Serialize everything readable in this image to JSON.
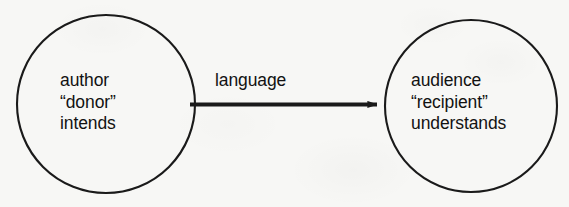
{
  "diagram": {
    "type": "node-edge-diagram",
    "background_color": "#f7f7f5",
    "stroke_color": "#1a1a1a",
    "text_color": "#121212",
    "nodes": [
      {
        "id": "author",
        "shape": "circle",
        "cx": 106,
        "cy": 104,
        "r": 89,
        "lines": [
          "author",
          "“donor”",
          "intends"
        ],
        "line1": "author",
        "line2": "“donor”",
        "line3": "intends"
      },
      {
        "id": "audience",
        "shape": "circle",
        "cx": 471,
        "cy": 106,
        "r": 86,
        "lines": [
          "audience",
          "“recipient”",
          "understands"
        ],
        "line1": "audience",
        "line2": "“recipient”",
        "line3": "understands"
      }
    ],
    "edges": [
      {
        "id": "language",
        "label": "language",
        "from": "author",
        "to": "audience",
        "arrow": "single-headed",
        "x1": 190,
        "x2": 386,
        "y": 105
      }
    ]
  }
}
